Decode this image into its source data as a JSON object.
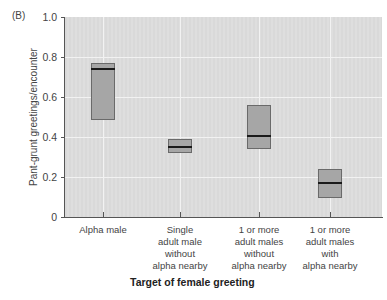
{
  "panel_label": "(B)",
  "chart_data": {
    "type": "box",
    "title": "",
    "xlabel": "Target of female greeting",
    "ylabel": "Pant-grunt greetings/encounter",
    "ylim": [
      0,
      1.0
    ],
    "yticks": [
      "0",
      "0.2",
      "0.4",
      "0.6",
      "0.8",
      "1.0"
    ],
    "grid": true,
    "categories": [
      "Alpha male",
      "Single\nadult male\nwithout\nalpha nearby",
      "1 or more\nadult males\nwithout\nalpha nearby",
      "1 or more\nadult males\nwith\nalpha nearby"
    ],
    "series": [
      {
        "name": "Alpha male",
        "q1": 0.485,
        "median": 0.74,
        "q3": 0.77
      },
      {
        "name": "Single adult male without alpha nearby",
        "q1": 0.32,
        "median": 0.35,
        "q3": 0.39
      },
      {
        "name": "1 or more adult males without alpha nearby",
        "q1": 0.34,
        "median": 0.405,
        "q3": 0.56
      },
      {
        "name": "1 or more adult males with alpha nearby",
        "q1": 0.095,
        "median": 0.17,
        "q3": 0.24
      }
    ]
  },
  "colors": {
    "plot_background": "#dcdcdc",
    "gridline": "#f2f2f2",
    "box_fill": "#a6a6a6",
    "box_border": "#6a6a6a",
    "median": "#1a1a1a"
  }
}
